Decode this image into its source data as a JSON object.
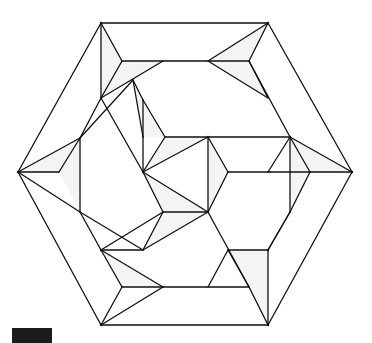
{
  "diagram": {
    "colors": {
      "line": "#111111",
      "shaded_face": "#f4f4f4",
      "background": "#ffffff",
      "corner_mark": "#1a1a1a"
    }
  }
}
